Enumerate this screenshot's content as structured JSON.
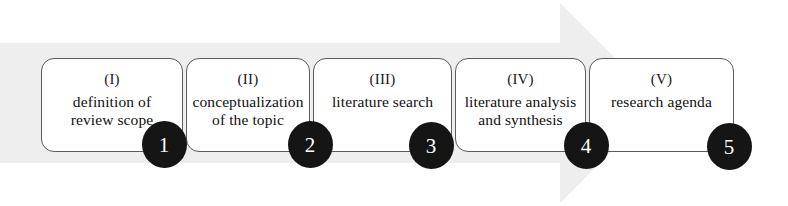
{
  "figure": {
    "type": "process-flow",
    "orientation": "left-to-right",
    "background_color": "#ffffff",
    "box_border_color": "#5c5c5c",
    "bullet_color": "#151515",
    "bullet_text_color": "#ffffff",
    "arrow_color": "#ededed"
  },
  "arrow": {
    "name": "background-process-arrow",
    "shape": "right-pointing-arrow",
    "shaft_top_y": 43,
    "shaft_bottom_y": 163,
    "head_start_x": 560,
    "head_tip_x": 660
  },
  "stages": [
    {
      "roman": "(I)",
      "label": "definition of\nreview scope",
      "number": "1",
      "x": 41,
      "y": 58,
      "width": 142,
      "height": 94
    },
    {
      "roman": "(II)",
      "label": "conceptualization\nof the topic",
      "number": "2",
      "x": 186,
      "y": 58,
      "width": 124,
      "height": 94
    },
    {
      "roman": "(III)",
      "label": "literature search",
      "number": "3",
      "x": 313,
      "y": 58,
      "width": 139,
      "height": 94
    },
    {
      "roman": "(IV)",
      "label": "literature analysis\nand synthesis",
      "number": "4",
      "x": 455,
      "y": 58,
      "width": 131,
      "height": 94
    },
    {
      "roman": "(V)",
      "label": "research agenda",
      "number": "5",
      "x": 589,
      "y": 58,
      "width": 145,
      "height": 94
    }
  ],
  "bullets": [
    {
      "number": "1",
      "cx": 164,
      "cy": 144
    },
    {
      "number": "2",
      "cx": 310,
      "cy": 144
    },
    {
      "number": "3",
      "cx": 431,
      "cy": 145
    },
    {
      "number": "4",
      "cx": 586,
      "cy": 145
    },
    {
      "number": "5",
      "cx": 729,
      "cy": 146
    }
  ]
}
